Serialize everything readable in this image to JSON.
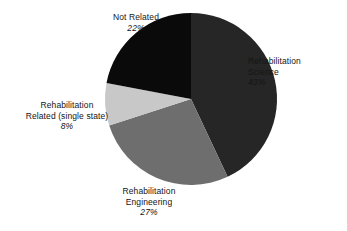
{
  "chart_data": {
    "type": "pie",
    "title": "",
    "categories": [
      "Rehabilitation Science",
      "Rehabilitation Engineering",
      "Rehabilitation Related (single state)",
      "Not Related"
    ],
    "values": [
      43,
      27,
      8,
      22
    ],
    "value_unit": "%",
    "legend": "none",
    "grid": false,
    "start_angle_deg": 0,
    "direction": "clockwise",
    "slices": [
      {
        "label_line1": "Rehabilitation",
        "label_line2": "Science",
        "percent": "43%",
        "value": 43,
        "color": "#262626",
        "start_deg": 0,
        "end_deg": 154.8
      },
      {
        "label_line1": "Rehabilitation",
        "label_line2": "Engineering",
        "percent": "27%",
        "value": 27,
        "color": "#6e6e6e",
        "start_deg": 154.8,
        "end_deg": 252.0
      },
      {
        "label_line1": "Rehabilitation",
        "label_line2": "Related (single state)",
        "percent": "8%",
        "value": 8,
        "color": "#c8c8c8",
        "start_deg": 252.0,
        "end_deg": 280.8
      },
      {
        "label_line1": "Not Related",
        "label_line2": "",
        "percent": "22%",
        "value": 22,
        "color": "#0a0a0a",
        "start_deg": 280.8,
        "end_deg": 360.0
      }
    ]
  },
  "geometry": {
    "center_x": 191,
    "center_y": 99,
    "radius": 86
  },
  "colors": {
    "background": "#ffffff",
    "text": "#151515",
    "slice_science": "#262626",
    "slice_engineering": "#6e6e6e",
    "slice_related": "#c8c8c8",
    "slice_not_related": "#0a0a0a"
  }
}
